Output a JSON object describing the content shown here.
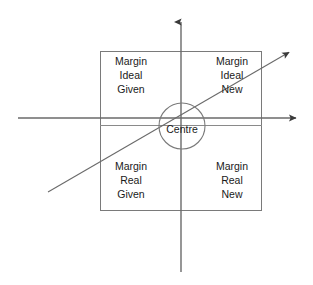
{
  "diagram": {
    "canvas": {
      "width": 313,
      "height": 285,
      "background": "#ffffff"
    },
    "stroke_color": "#5a5a5a",
    "text_color": "#1a1a1a",
    "quadrants": [
      {
        "id": "top-left",
        "position": "upper-left",
        "lines": [
          "Margin",
          "Ideal",
          "Given"
        ],
        "line1": "Margin",
        "line2": "Ideal",
        "line3": "Given"
      },
      {
        "id": "top-right",
        "position": "upper-right",
        "lines": [
          "Margin",
          "Ideal",
          "New"
        ],
        "line1": "Margin",
        "line2": "Ideal",
        "line3": "New"
      },
      {
        "id": "bottom-left",
        "position": "lower-left",
        "lines": [
          "Margin",
          "Real",
          "Given"
        ],
        "line1": "Margin",
        "line2": "Real",
        "line3": "Given"
      },
      {
        "id": "bottom-right",
        "position": "lower-right",
        "lines": [
          "Margin",
          "Real",
          "New"
        ],
        "line1": "Margin",
        "line2": "Real",
        "line3": "New"
      }
    ],
    "centre": {
      "label": "Centre",
      "cx": 182,
      "cy": 126,
      "r": 23
    },
    "axes": {
      "vertical": {
        "x": 181,
        "y_top": 18,
        "y_bottom": 272,
        "arrow": "up"
      },
      "horizontal": {
        "y": 118,
        "x_left": 18,
        "x_right": 300,
        "arrow": "right"
      },
      "diagonal": {
        "x1": 48,
        "y1": 192,
        "x2": 293,
        "y2": 50,
        "arrow": "upper-right"
      }
    },
    "box": {
      "x": 100,
      "y": 51,
      "width": 162,
      "height": 160
    },
    "divider": {
      "y": 125,
      "x_left": 100,
      "x_right": 262
    }
  }
}
